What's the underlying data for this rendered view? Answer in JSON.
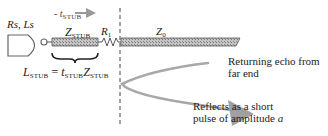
{
  "diagram": {
    "source_label": {
      "main": "Rs, Ls"
    },
    "time_arrow_label": {
      "prefix": "- t",
      "sub": "STUB"
    },
    "stub_label": {
      "main": "Z",
      "sub": "STUB"
    },
    "resistor_label": {
      "main": "R",
      "sub": "1"
    },
    "line_label": {
      "main": "Z",
      "sub": "0"
    },
    "equation": {
      "lhs_main": "L",
      "lhs_sub": "STUB",
      "equals": "=",
      "t_main": "t",
      "t_sub": "STUB",
      "z_main": "Z",
      "z_sub": "STUB"
    },
    "annotations": {
      "echo": [
        "Returning echo from",
        "far end"
      ],
      "reflect_line1": "Reflects as a short",
      "reflect_line2_prefix": "pulse of amplitude ",
      "reflect_line2_var": "a"
    },
    "colors": {
      "line_fill": "#b8b8b8",
      "line_stroke": "#555555",
      "curve": "#a8a8a8",
      "text": "#222222"
    }
  }
}
